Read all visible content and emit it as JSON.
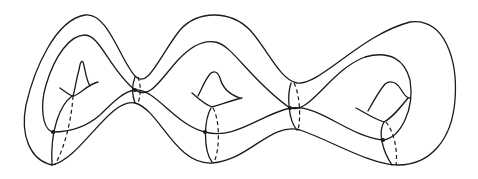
{
  "figure": {
    "genus": 3,
    "stroke_color": "#1a1a1a",
    "background": "#ffffff",
    "handles": [
      {
        "name": "left-handle",
        "hole_center": [
          75,
          78
        ]
      },
      {
        "name": "middle-handle",
        "hole_center": [
          212,
          88
        ]
      },
      {
        "name": "right-handle",
        "hole_center": [
          393,
          100
        ]
      }
    ],
    "cross_section_curves": [
      {
        "name": "left-end-curve",
        "x": 60
      },
      {
        "name": "waist-1-curve",
        "x": 135
      },
      {
        "name": "middle-curve",
        "x": 210
      },
      {
        "name": "waist-2-curve",
        "x": 293
      },
      {
        "name": "right-end-curve",
        "x": 388
      }
    ],
    "marked_points": [
      [
        53,
        132
      ],
      [
        135,
        90
      ],
      [
        205,
        132
      ],
      [
        290,
        108
      ],
      [
        383,
        140
      ]
    ]
  }
}
